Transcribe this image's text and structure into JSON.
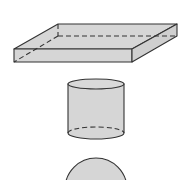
{
  "diagram": {
    "type": "3d-solids",
    "shapes": [
      {
        "name": "rectangular-prism",
        "description": "flat rectangular box with hidden edges dashed"
      },
      {
        "name": "cylinder",
        "description": "cylinder with hidden bottom back edge dashed"
      },
      {
        "name": "sphere",
        "description": "sphere, partially cut off at bottom"
      }
    ],
    "colors": {
      "fill": "#d6d6d6",
      "stroke": "#333333",
      "background": "#ffffff"
    }
  }
}
